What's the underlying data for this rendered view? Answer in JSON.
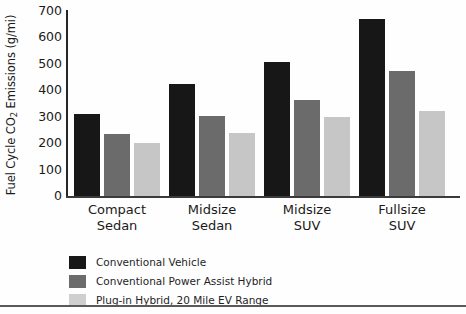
{
  "chart_data": {
    "type": "bar",
    "title": "",
    "xlabel": "",
    "ylabel": "Fuel Cycle CO2 Emissions (g/mi)",
    "ylabel_parts": {
      "before": "Fuel Cycle CO",
      "sub": "2",
      "after": " Emissions (g/mi)"
    },
    "categories": [
      "Compact Sedan",
      "Midsize Sedan",
      "Midsize SUV",
      "Fullsize SUV"
    ],
    "category_lines": [
      [
        "Compact",
        "Sedan"
      ],
      [
        "Midsize",
        "Sedan"
      ],
      [
        "Midsize",
        "SUV"
      ],
      [
        "Fullsize",
        "SUV"
      ]
    ],
    "series": [
      {
        "name": "Conventional Vehicle",
        "color": "#171717",
        "values": [
          310,
          425,
          508,
          668
        ]
      },
      {
        "name": "Conventional Power Assist Hybrid",
        "color": "#6b6b6b",
        "values": [
          235,
          303,
          365,
          473
        ]
      },
      {
        "name": "Plug-in Hybrid, 20 Mile EV Range",
        "color": "#c6c6c6",
        "values": [
          200,
          238,
          300,
          323
        ]
      }
    ],
    "ylim": [
      0,
      700
    ],
    "yticks": [
      0,
      100,
      200,
      300,
      400,
      500,
      600,
      700
    ],
    "ytick_labels": [
      "0",
      "100",
      "200",
      "300",
      "400",
      "500",
      "600",
      "700"
    ],
    "grid": false,
    "legend_position": "below-left"
  },
  "legend": {
    "entries": [
      "Conventional Vehicle",
      "Conventional Power Assist Hybrid",
      "Plug-in Hybrid, 20 Mile EV Range"
    ]
  }
}
